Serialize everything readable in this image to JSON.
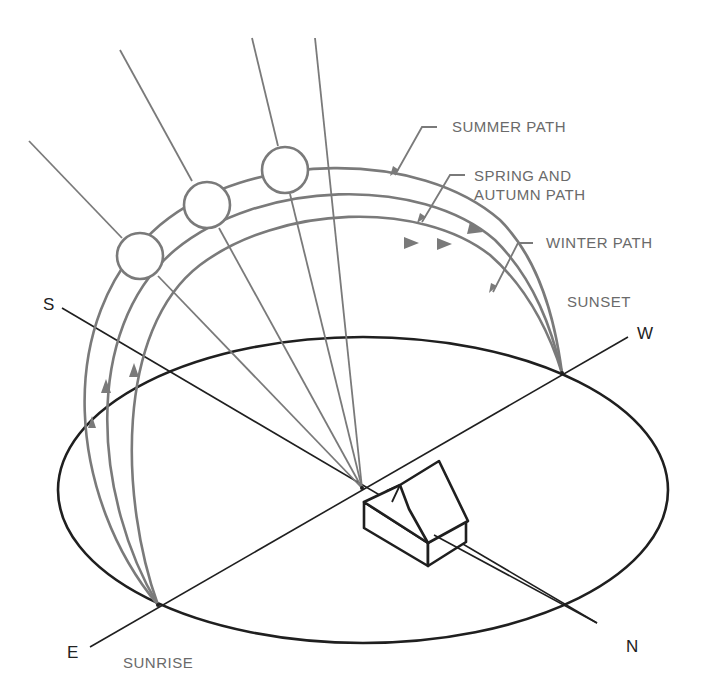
{
  "diagram": {
    "type": "sun path diagram",
    "colors": {
      "ground": "#1f1f1f",
      "sun_path": "#7a7a7a",
      "label_gray": "#6a6a6a",
      "label_dark": "#222222",
      "background": "#ffffff"
    },
    "labels": {
      "summer_path": "SUMMER PATH",
      "spring_line1": "SPRING AND",
      "spring_line2": "AUTUMN PATH",
      "winter_path": "WINTER PATH",
      "sunset": "SUNSET",
      "sunrise": "SUNRISE"
    },
    "directions": {
      "south": "S",
      "west": "W",
      "east": "E",
      "north": "N"
    },
    "paths": [
      {
        "name": "summer",
        "label": "SUMMER PATH"
      },
      {
        "name": "spring-autumn",
        "label": "SPRING AND AUTUMN PATH"
      },
      {
        "name": "winter",
        "label": "WINTER PATH"
      }
    ],
    "suns": [
      {
        "name": "winter-noon-sun"
      },
      {
        "name": "equinox-noon-sun"
      },
      {
        "name": "summer-noon-sun"
      }
    ]
  }
}
